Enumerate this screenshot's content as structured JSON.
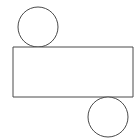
{
  "canvas": {
    "width": 140,
    "height": 140,
    "background_color": "#ffffff",
    "title": "Geometric Figure"
  },
  "style": {
    "stroke_color": "#4a4a4a",
    "fill_color": "#ffffff",
    "stroke_width": 1
  },
  "chart_data": {
    "type": "diagram",
    "title": "",
    "coordinate_system": "pixels, origin at top-left",
    "shapes": [
      {
        "id": "top-circle",
        "name": "Top circle",
        "type": "circle",
        "cx": 38,
        "cy": 27,
        "r": 20,
        "fill": "#ffffff",
        "stroke": "#4a4a4a",
        "stroke_width": 1,
        "relation": "tangent to rectangle top edge"
      },
      {
        "id": "main-rectangle",
        "name": "Rectangle",
        "type": "rect",
        "x": 13,
        "y": 47,
        "width": 120,
        "height": 50,
        "fill": "#ffffff",
        "stroke": "#4a4a4a",
        "stroke_width": 1,
        "relation": "horizontal bar spanning most of the canvas width"
      },
      {
        "id": "bottom-circle",
        "name": "Bottom circle",
        "type": "circle",
        "cx": 108,
        "cy": 117,
        "r": 20,
        "fill": "#ffffff",
        "stroke": "#4a4a4a",
        "stroke_width": 1,
        "relation": "tangent to rectangle bottom edge"
      }
    ],
    "labels": [],
    "legend": [],
    "grid": false
  }
}
